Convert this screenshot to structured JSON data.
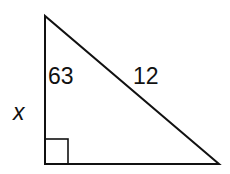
{
  "diagram": {
    "type": "right-triangle",
    "labels": {
      "angle": "63",
      "hypotenuse": "12",
      "side": "x"
    },
    "colors": {
      "stroke": "#111111",
      "background": "#ffffff"
    }
  }
}
